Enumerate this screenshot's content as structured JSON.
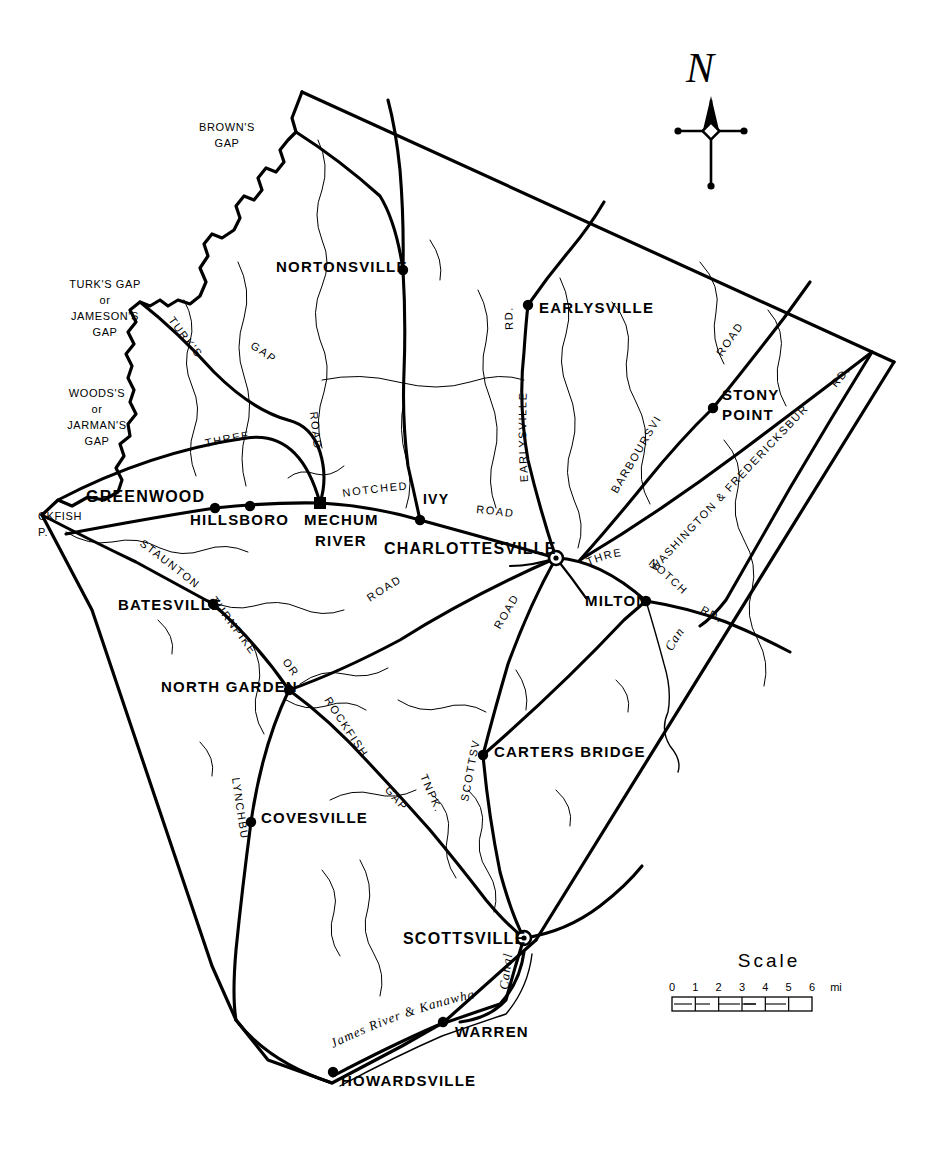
{
  "map": {
    "title_hidden": "",
    "compass": {
      "letter": "N",
      "name": "north-arrow"
    },
    "scale": {
      "label": "Scale",
      "ticks": [
        "0",
        "1",
        "2",
        "3",
        "4",
        "5",
        "6"
      ],
      "unit": "mi"
    },
    "places": [
      {
        "name": "NORTONSVILLE",
        "x": 276,
        "y": 272,
        "mx": 403,
        "my": 270,
        "marker": "dot",
        "anchor": "start",
        "size": 15
      },
      {
        "name": "EARLYSVILLE",
        "x": 539,
        "y": 313,
        "mx": 528,
        "my": 305,
        "marker": "dot",
        "anchor": "start",
        "size": 15
      },
      {
        "name": "STONY",
        "x": 722,
        "y": 400,
        "mx": 713,
        "my": 408,
        "marker": "dot",
        "anchor": "start",
        "size": 15
      },
      {
        "name": "POINT",
        "x": 722,
        "y": 420,
        "mx": null,
        "my": null,
        "marker": "none",
        "anchor": "start",
        "size": 15
      },
      {
        "name": "GREENWOOD",
        "x": 86,
        "y": 502,
        "mx": 215,
        "my": 508,
        "marker": "dot",
        "anchor": "start",
        "size": 16
      },
      {
        "name": "HILLSBORO",
        "x": 190,
        "y": 525,
        "mx": 250,
        "my": 506,
        "marker": "dot",
        "anchor": "start",
        "size": 15
      },
      {
        "name": "MECHUM",
        "x": 304,
        "y": 525,
        "mx": 320,
        "my": 503,
        "marker": "square",
        "anchor": "start",
        "size": 15
      },
      {
        "name": "RIVER",
        "x": 315,
        "y": 546,
        "mx": null,
        "my": null,
        "marker": "none",
        "anchor": "start",
        "size": 15
      },
      {
        "name": "IVY",
        "x": 423,
        "y": 504,
        "mx": 420,
        "my": 520,
        "marker": "dot",
        "anchor": "start",
        "size": 14
      },
      {
        "name": "CHARLOTTESVILLE",
        "x": 384,
        "y": 554,
        "mx": 556,
        "my": 558,
        "marker": "donut",
        "anchor": "start",
        "size": 16
      },
      {
        "name": "BATESVILLE",
        "x": 118,
        "y": 610,
        "mx": 213,
        "my": 604,
        "marker": "dot",
        "anchor": "start",
        "size": 15
      },
      {
        "name": "MILTON",
        "x": 585,
        "y": 606,
        "mx": 646,
        "my": 601,
        "marker": "dot",
        "anchor": "start",
        "size": 15
      },
      {
        "name": "NORTH GARDEN",
        "x": 161,
        "y": 692,
        "mx": 289,
        "my": 690,
        "marker": "dot",
        "anchor": "start",
        "size": 15
      },
      {
        "name": "CARTERS BRIDGE",
        "x": 494,
        "y": 757,
        "mx": 483,
        "my": 755,
        "marker": "dot",
        "anchor": "start",
        "size": 15
      },
      {
        "name": "COVESVILLE",
        "x": 261,
        "y": 823,
        "mx": 251,
        "my": 822,
        "marker": "dot",
        "anchor": "start",
        "size": 15
      },
      {
        "name": "SCOTTSVILLE",
        "x": 403,
        "y": 944,
        "mx": 524,
        "my": 938,
        "marker": "donut",
        "anchor": "start",
        "size": 16
      },
      {
        "name": "WARREN",
        "x": 455,
        "y": 1037,
        "mx": 443,
        "my": 1022,
        "marker": "dot",
        "anchor": "start",
        "size": 15
      },
      {
        "name": "HOWARDSVILLE",
        "x": 341,
        "y": 1086,
        "mx": 333,
        "my": 1072,
        "marker": "dot",
        "anchor": "start",
        "size": 15
      }
    ],
    "gaps": [
      {
        "lines": [
          "BROWN'S",
          "GAP"
        ],
        "x": 227,
        "y": 131,
        "align": "middle"
      },
      {
        "lines": [
          "TURK'S GAP",
          "or",
          "JAMESON'S",
          "GAP"
        ],
        "x": 105,
        "y": 288,
        "align": "middle"
      },
      {
        "lines": [
          "WOODS'S",
          "or",
          "JARMAN'S",
          "GAP"
        ],
        "x": 97,
        "y": 397,
        "align": "middle"
      },
      {
        "lines": [
          "CKFISH",
          "P."
        ],
        "x": 38,
        "y": 520,
        "align": "start"
      }
    ],
    "road_labels": [
      {
        "text": "TURK'S",
        "path": "turks-path"
      },
      {
        "text": "GAP",
        "path": "turksgap-path"
      },
      {
        "text": "ROAD",
        "path": "turkroad-path"
      },
      {
        "text": "THREE",
        "path": "three-path"
      },
      {
        "text": "NOTCHED",
        "path": "notched-path"
      },
      {
        "text": "ROAD",
        "path": "notchedroad-path"
      },
      {
        "text": "RD.",
        "path": "earlysvillerd-path"
      },
      {
        "text": "EARLYSVILLE",
        "path": "earlysville-path"
      },
      {
        "text": "ROAD",
        "path": "stonyroad-path"
      },
      {
        "text": "RD.",
        "path": "nerd-path"
      },
      {
        "text": "BARBOURSVILLE",
        "path": "barboursville-path"
      },
      {
        "text": "WASHINGTON & FREDERICKSBURG",
        "path": "washfred-path"
      },
      {
        "text": "THREE",
        "path": "three2-path"
      },
      {
        "text": "NOTCHED",
        "path": "notched2-path"
      },
      {
        "text": "RD.",
        "path": "notched2rd-path"
      },
      {
        "text": "STAUNTON",
        "path": "staunton-path"
      },
      {
        "text": "TURNPIKE",
        "path": "turnpike-path"
      },
      {
        "text": "OR",
        "path": "or-path"
      },
      {
        "text": "ROCKFISH",
        "path": "rockfish-path"
      },
      {
        "text": "GAP",
        "path": "rfgap-path"
      },
      {
        "text": "TNPK.",
        "path": "tnpk-path"
      },
      {
        "text": "LYNCHBURG",
        "path": "lynchburg-path"
      },
      {
        "text": "ROAD",
        "path": "cvilleroad-path"
      },
      {
        "text": "ROAD",
        "path": "scottroad-path"
      },
      {
        "text": "SCOTTSVILLE",
        "path": "scottsville-path"
      },
      {
        "text": "Canal",
        "path": "canal1-path"
      },
      {
        "text": "Canal",
        "path": "canal2-path"
      },
      {
        "text": "James River & Kanawha",
        "path": "jamesriver-path"
      }
    ]
  }
}
